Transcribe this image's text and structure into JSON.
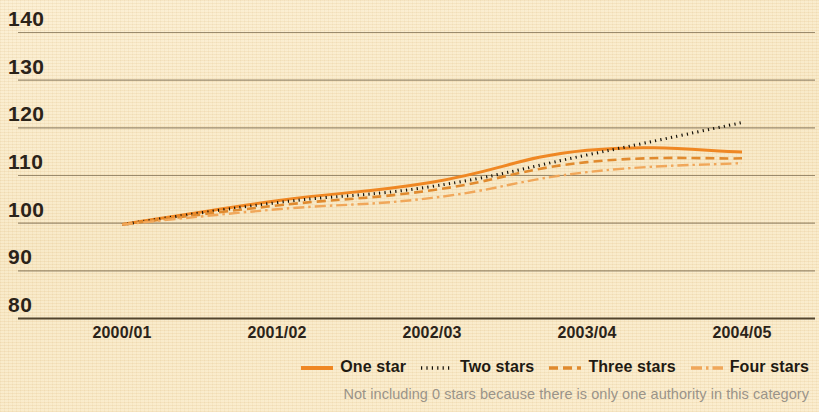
{
  "chart_data": {
    "type": "line",
    "title": "",
    "xlabel": "",
    "ylabel": "",
    "x": [
      "2000/01",
      "2001/02",
      "2002/03",
      "2003/04",
      "2004/05"
    ],
    "categories": [
      "2000/01",
      "2001/02",
      "2002/03",
      "2003/04",
      "2004/05"
    ],
    "ylim": [
      80,
      140
    ],
    "yticks": [
      80,
      90,
      100,
      110,
      120,
      130,
      140
    ],
    "grid": true,
    "legend_position": "bottom-right",
    "series": [
      {
        "name": "One star",
        "style": "solid",
        "color": "#ef8723",
        "values": [
          99.6,
          104.6,
          108.5,
          115.2,
          114.8
        ]
      },
      {
        "name": "Two stars",
        "style": "dotted",
        "color": "#141008",
        "values": [
          99.6,
          104.2,
          107.6,
          114.2,
          121.0
        ]
      },
      {
        "name": "Three stars",
        "style": "dashed",
        "color": "#e08a2e",
        "values": [
          99.6,
          103.6,
          106.8,
          112.7,
          113.5
        ]
      },
      {
        "name": "Four stars",
        "style": "dashdot",
        "color": "#f0a75a",
        "values": [
          99.6,
          102.8,
          105.2,
          110.6,
          112.5
        ]
      }
    ],
    "annotations": [
      "Not including 0 stars because there is only one authority in this category"
    ]
  },
  "axis": {
    "y_tick_labels": [
      "140",
      "130",
      "120",
      "110",
      "100",
      "90",
      "80"
    ],
    "x_tick_labels": [
      "2000/01",
      "2001/02",
      "2002/03",
      "2003/04",
      "2004/05"
    ]
  },
  "legend": {
    "items": [
      {
        "label": "One star",
        "style": "solid"
      },
      {
        "label": "Two stars",
        "style": "dotted"
      },
      {
        "label": "Three stars",
        "style": "dashed"
      },
      {
        "label": "Four stars",
        "style": "dashdot"
      }
    ]
  },
  "footnote": {
    "text": "Not including 0 stars because there is only one authority in this category"
  },
  "colors": {
    "background": "#f8e8c6",
    "gridline": "#7c6b4e",
    "axis": "#4a3c26",
    "one_star": "#ef8723",
    "two_stars": "#141008",
    "three_stars": "#e08a2e",
    "four_stars": "#f0a75a",
    "text": "#2b2319",
    "footnote": "#9a9388"
  }
}
